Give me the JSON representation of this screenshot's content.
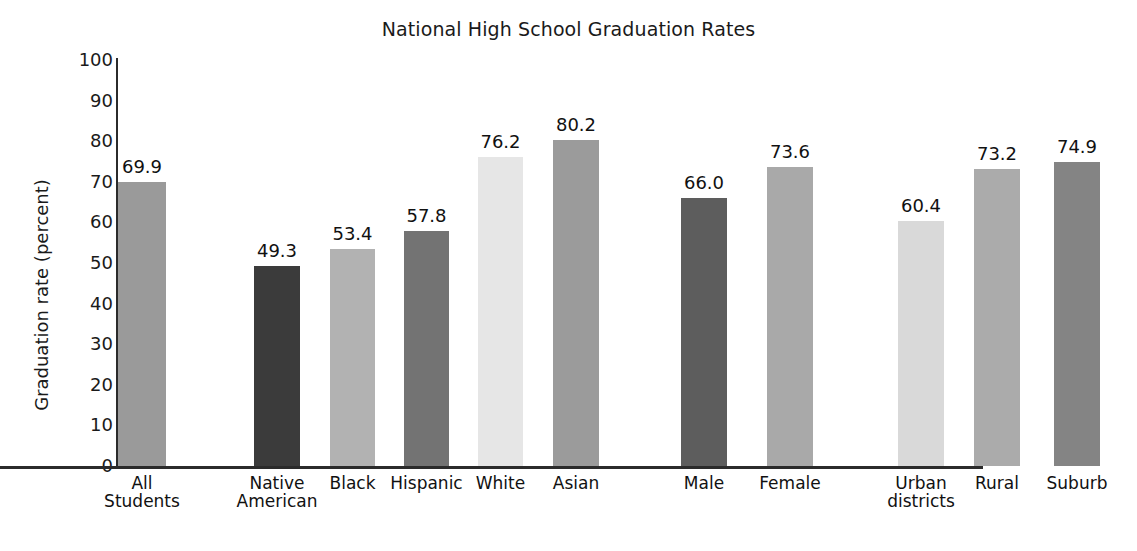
{
  "chart_data": {
    "type": "bar",
    "title": "National High School Graduation Rates",
    "xlabel": "",
    "ylabel": "Graduation rate (percent)",
    "ylim": [
      0,
      100
    ],
    "yticks": [
      0,
      10,
      20,
      30,
      40,
      50,
      60,
      70,
      80,
      90,
      100
    ],
    "ytick_labels": [
      "0",
      "10",
      "20",
      "30",
      "40",
      "50",
      "60",
      "70",
      "80",
      "90",
      "100"
    ],
    "grid": false,
    "legend": "none",
    "value_labels_shown": true,
    "categories": [
      "All\nStudents",
      "Native\nAmerican",
      "Black",
      "Hispanic",
      "White",
      "Asian",
      "Male",
      "Female",
      "Urban\ndistricts",
      "Rural",
      "Suburb"
    ],
    "values": [
      69.9,
      49.3,
      53.4,
      57.8,
      76.2,
      80.2,
      66.0,
      73.6,
      60.4,
      73.2,
      74.9
    ],
    "value_labels": [
      "69.9",
      "49.3",
      "53.4",
      "57.8",
      "76.2",
      "80.2",
      "66.0",
      "73.6",
      "60.4",
      "73.2",
      "74.9"
    ],
    "bar_colors": [
      "#9a9a9a",
      "#3b3b3b",
      "#b2b2b2",
      "#737373",
      "#e6e6e6",
      "#9b9b9b",
      "#5d5d5d",
      "#a9a9a9",
      "#d9d9d9",
      "#ababab",
      "#848484"
    ],
    "groups": [
      {
        "name": "overall",
        "members": [
          "All Students"
        ]
      },
      {
        "name": "race-ethnicity",
        "members": [
          "Native American",
          "Black",
          "Hispanic",
          "White",
          "Asian"
        ]
      },
      {
        "name": "gender",
        "members": [
          "Male",
          "Female"
        ]
      },
      {
        "name": "locale",
        "members": [
          "Urban districts",
          "Rural",
          "Suburb"
        ]
      }
    ],
    "axis_color": "#2b2b2b",
    "background": "#ffffff"
  },
  "bars": [
    {
      "label": "69.9",
      "cat": "All\nStudents",
      "value": 69.9,
      "x": 118,
      "w": 48,
      "color": "#9a9a9a"
    },
    {
      "label": "49.3",
      "cat": "Native\nAmerican",
      "value": 49.3,
      "x": 254,
      "w": 46,
      "color": "#3b3b3b"
    },
    {
      "label": "53.4",
      "cat": "Black",
      "value": 53.4,
      "x": 330,
      "w": 45,
      "color": "#b2b2b2"
    },
    {
      "label": "57.8",
      "cat": "Hispanic",
      "value": 57.8,
      "x": 404,
      "w": 45,
      "color": "#737373"
    },
    {
      "label": "76.2",
      "cat": "White",
      "value": 76.2,
      "x": 478,
      "w": 45,
      "color": "#e6e6e6"
    },
    {
      "label": "80.2",
      "cat": "Asian",
      "value": 80.2,
      "x": 553,
      "w": 46,
      "color": "#9b9b9b"
    },
    {
      "label": "66.0",
      "cat": "Male",
      "value": 66.0,
      "x": 681,
      "w": 46,
      "color": "#5d5d5d"
    },
    {
      "label": "73.6",
      "cat": "Female",
      "value": 73.6,
      "x": 767,
      "w": 46,
      "color": "#a9a9a9"
    },
    {
      "label": "60.4",
      "cat": "Urban\ndistricts",
      "value": 60.4,
      "x": 898,
      "w": 46,
      "color": "#d9d9d9"
    },
    {
      "label": "73.2",
      "cat": "Rural",
      "value": 73.2,
      "x": 974,
      "w": 46,
      "color": "#ababab"
    },
    {
      "label": "74.9",
      "cat": "Suburb",
      "value": 74.9,
      "x": 1054,
      "w": 46,
      "color": "#848484"
    }
  ]
}
